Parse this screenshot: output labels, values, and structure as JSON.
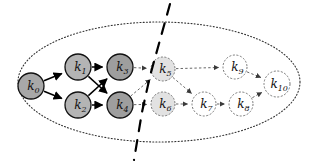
{
  "figure": {
    "type": "directed-graph-diagram",
    "background_color": "#ffffff",
    "outline_color": "#111111"
  },
  "boundary": {
    "name": "enclosing-ellipse",
    "style": "dotted",
    "cx": 159,
    "cy": 82,
    "rx": 141,
    "ry": 60,
    "stroke": "#333333"
  },
  "partition": {
    "name": "partition-curve",
    "style": "dashed",
    "stroke": "#000000",
    "label": "",
    "path": "M 170 4 L 160 40 L 150 76 L 142 112 L 134 160"
  },
  "nodes": [
    {
      "id": "k0",
      "label": "k",
      "subscript": "0",
      "cx": 31,
      "cy": 86,
      "r": 13,
      "fill": "#a8a8a8",
      "stroke": "#111111",
      "edge_style": "solid",
      "group": "left"
    },
    {
      "id": "k1",
      "label": "k",
      "subscript": "1",
      "cx": 78,
      "cy": 67,
      "r": 13,
      "fill": "#b4b4b4",
      "stroke": "#111111",
      "edge_style": "solid",
      "group": "left"
    },
    {
      "id": "k2",
      "label": "k",
      "subscript": "2",
      "cx": 78,
      "cy": 105,
      "r": 13,
      "fill": "#b4b4b4",
      "stroke": "#111111",
      "edge_style": "solid",
      "group": "left"
    },
    {
      "id": "k3",
      "label": "k",
      "subscript": "3",
      "cx": 120,
      "cy": 67,
      "r": 13,
      "fill": "#9e9e9e",
      "stroke": "#111111",
      "edge_style": "solid",
      "group": "left"
    },
    {
      "id": "k4",
      "label": "k",
      "subscript": "4",
      "cx": 120,
      "cy": 105,
      "r": 13,
      "fill": "#9e9e9e",
      "stroke": "#111111",
      "edge_style": "solid",
      "group": "left"
    },
    {
      "id": "k5",
      "label": "k",
      "subscript": "5",
      "cx": 163,
      "cy": 69,
      "r": 12,
      "fill": "#e2e2e2",
      "stroke": "#777777",
      "edge_style": "dashed",
      "group": "right"
    },
    {
      "id": "k6",
      "label": "k",
      "subscript": "6",
      "cx": 163,
      "cy": 104,
      "r": 12,
      "fill": "#e2e2e2",
      "stroke": "#777777",
      "edge_style": "dashed",
      "group": "right"
    },
    {
      "id": "k7",
      "label": "k",
      "subscript": "7",
      "cx": 204,
      "cy": 104,
      "r": 12,
      "fill": "#ffffff",
      "stroke": "#777777",
      "edge_style": "dashed",
      "group": "right"
    },
    {
      "id": "k8",
      "label": "k",
      "subscript": "8",
      "cx": 241,
      "cy": 104,
      "r": 12,
      "fill": "#ffffff",
      "stroke": "#777777",
      "edge_style": "dashed",
      "group": "right"
    },
    {
      "id": "k9",
      "label": "k",
      "subscript": "9",
      "cx": 235,
      "cy": 67,
      "r": 12,
      "fill": "#ffffff",
      "stroke": "#777777",
      "edge_style": "dashed",
      "group": "right"
    },
    {
      "id": "k10",
      "label": "k",
      "subscript": "10",
      "cx": 277,
      "cy": 84,
      "r": 13,
      "fill": "#ffffff",
      "stroke": "#777777",
      "edge_style": "dashed",
      "group": "right"
    }
  ],
  "edges": [
    {
      "from": "k0",
      "to": "k1",
      "style": "solid",
      "name": "edge-k0-k1"
    },
    {
      "from": "k0",
      "to": "k2",
      "style": "solid",
      "name": "edge-k0-k2"
    },
    {
      "from": "k1",
      "to": "k3",
      "style": "solid",
      "name": "edge-k1-k3"
    },
    {
      "from": "k1",
      "to": "k4",
      "style": "solid",
      "name": "edge-k1-k4"
    },
    {
      "from": "k2",
      "to": "k3",
      "style": "solid",
      "name": "edge-k2-k3"
    },
    {
      "from": "k2",
      "to": "k4",
      "style": "solid",
      "name": "edge-k2-k4"
    },
    {
      "from": "k3",
      "to": "k5",
      "style": "dashed",
      "name": "edge-k3-k5"
    },
    {
      "from": "k4",
      "to": "k5",
      "style": "dashed",
      "name": "edge-k4-k5"
    },
    {
      "from": "k4",
      "to": "k6",
      "style": "dashed",
      "name": "edge-k4-k6"
    },
    {
      "from": "k5",
      "to": "k9",
      "style": "dashed",
      "name": "edge-k5-k9"
    },
    {
      "from": "k5",
      "to": "k7",
      "style": "dashed",
      "name": "edge-k5-k7"
    },
    {
      "from": "k6",
      "to": "k7",
      "style": "dashed",
      "name": "edge-k6-k7"
    },
    {
      "from": "k7",
      "to": "k8",
      "style": "dashed",
      "name": "edge-k7-k8"
    },
    {
      "from": "k8",
      "to": "k10",
      "style": "dashed",
      "name": "edge-k8-k10"
    },
    {
      "from": "k9",
      "to": "k10",
      "style": "dashed",
      "name": "edge-k9-k10"
    }
  ]
}
